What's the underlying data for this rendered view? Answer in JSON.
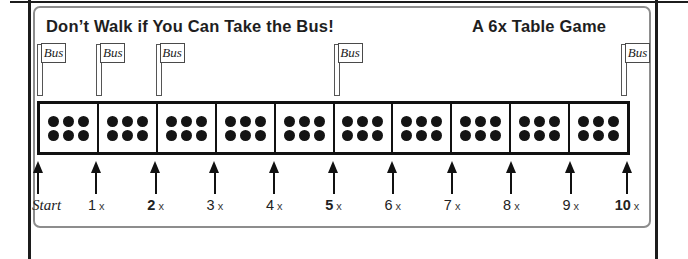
{
  "header": {
    "title_left": "Don’t Walk if You Can Take the Bus!",
    "title_right": "A 6x Table Game"
  },
  "flag_label": "Bus",
  "track": {
    "cells": 10,
    "dots_per_cell": 6
  },
  "stops": [
    {
      "label": "Start",
      "suffix": "",
      "bold": false,
      "bus_flag": true
    },
    {
      "label": "1",
      "suffix": "x",
      "bold": false,
      "bus_flag": true
    },
    {
      "label": "2",
      "suffix": "x",
      "bold": true,
      "bus_flag": true
    },
    {
      "label": "3",
      "suffix": "x",
      "bold": false,
      "bus_flag": false
    },
    {
      "label": "4",
      "suffix": "x",
      "bold": false,
      "bus_flag": false
    },
    {
      "label": "5",
      "suffix": "x",
      "bold": true,
      "bus_flag": true
    },
    {
      "label": "6",
      "suffix": "x",
      "bold": false,
      "bus_flag": false
    },
    {
      "label": "7",
      "suffix": "x",
      "bold": false,
      "bus_flag": false
    },
    {
      "label": "8",
      "suffix": "x",
      "bold": false,
      "bus_flag": false
    },
    {
      "label": "9",
      "suffix": "x",
      "bold": false,
      "bus_flag": false
    },
    {
      "label": "10",
      "suffix": "x",
      "bold": true,
      "bus_flag": true
    }
  ],
  "colors": {
    "page_line": "#1c1c1c",
    "frame": "#8d8d8d",
    "ink": "#1e1e1e",
    "dot": "#141414"
  }
}
